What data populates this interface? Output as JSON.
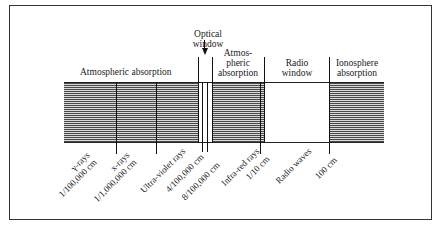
{
  "diagram": {
    "type": "electromagnetic-spectrum-atmospheric-windows",
    "regions": [
      {
        "id": "atmospheric-absorption-1",
        "label": "Atmospheric absorption",
        "style": "hatched"
      },
      {
        "id": "optical-window",
        "label_line1": "Optical",
        "label_line2": "window",
        "style": "open"
      },
      {
        "id": "atmospheric-absorption-2",
        "label_line1": "Atmos-",
        "label_line2": "pheric",
        "label_line3": "absorption",
        "style": "hatched"
      },
      {
        "id": "radio-window",
        "label_line1": "Radio",
        "label_line2": "window",
        "style": "open"
      },
      {
        "id": "ionosphere-absorption",
        "label_line1": "Ionosphere",
        "label_line2": "absorption",
        "style": "hatched"
      }
    ],
    "bottom_labels": [
      {
        "line1": "γ-rays",
        "line2": "1/100,000 cm"
      },
      {
        "line1": "x-rays",
        "line2": "1/1,000,000 cm"
      },
      {
        "line1": "Ultra-violet rays"
      },
      {
        "line1": "4/100,000 cm"
      },
      {
        "line1": "8/100,000 cm"
      },
      {
        "line1": "Infra-red rays"
      },
      {
        "line1": "1/10 cm"
      },
      {
        "line1": "Radio waves"
      },
      {
        "line1": "100 cm"
      }
    ]
  }
}
